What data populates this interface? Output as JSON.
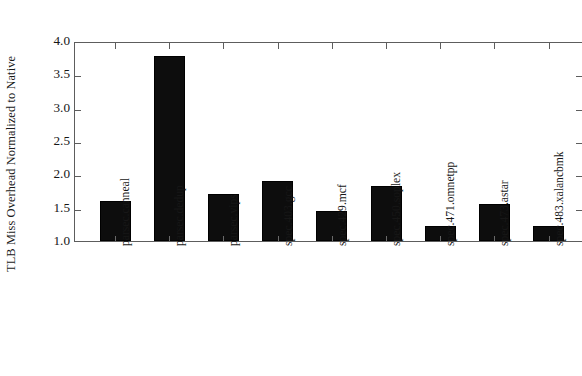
{
  "chart_data": {
    "type": "bar",
    "title": "",
    "subtitle": "",
    "xlabel": "",
    "ylabel": "TLB Miss Overhead Normalized to Native",
    "categories": [
      "parsec.canneal",
      "parsec.dedup",
      "parsec.vips",
      "spec.403.gcc",
      "spec.429.mcf",
      "spec.450.soplex",
      "spec.471.omnetpp",
      "spec.473.astar",
      "spec.483.xalancbmk"
    ],
    "values": [
      1.6,
      3.77,
      1.7,
      1.9,
      1.45,
      1.82,
      1.23,
      1.56,
      1.22
    ],
    "ylim": [
      1.0,
      4.0
    ],
    "yticks": [
      1.0,
      1.5,
      2.0,
      2.5,
      3.0,
      3.5,
      4.0
    ],
    "ytick_labels": [
      "1.0",
      "1.5",
      "2.0",
      "2.5",
      "3.0",
      "3.5",
      "4.0"
    ],
    "ytick_step": 0.5,
    "grid": false,
    "legend": null,
    "legend_position": "none",
    "bar_color": "#0d0d0d",
    "axis_color": "#5d5d5d",
    "background_color": "#ffffff",
    "xlabel_rotation": -90,
    "baseline": 1.0
  }
}
